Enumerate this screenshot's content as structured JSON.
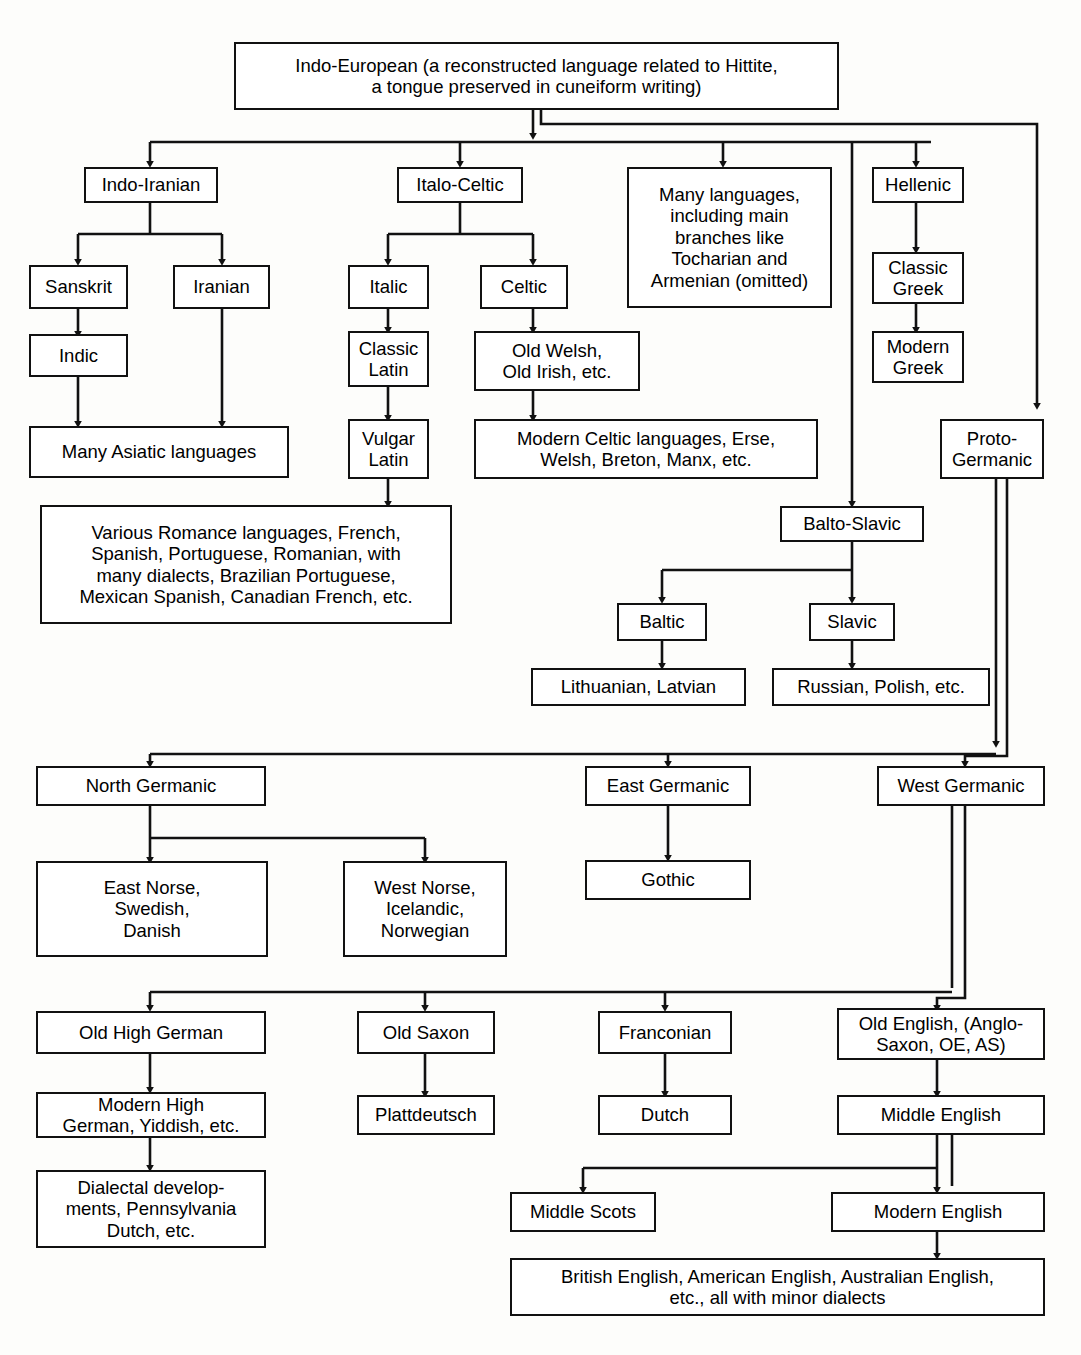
{
  "diagram": {
    "colors": {
      "ink": "#111111",
      "paper": "#fdfdfb",
      "box_fill": "#ffffff"
    },
    "nodes": {
      "indo_european": "Indo-European (a reconstructed language related to Hittite,\na tongue preserved in cuneiform writing)",
      "indo_iranian": "Indo-Iranian",
      "italo_celtic": "Italo-Celtic",
      "many_languages": "Many languages,\nincluding main\nbranches like\nTocharian and\nArmenian (omitted)",
      "hellenic": "Hellenic",
      "sanskrit": "Sanskrit",
      "iranian": "Iranian",
      "italic": "Italic",
      "celtic": "Celtic",
      "classic_greek": "Classic\nGreek",
      "indic": "Indic",
      "classic_latin": "Classic\nLatin",
      "old_welsh": "Old Welsh,\nOld Irish, etc.",
      "modern_greek": "Modern\nGreek",
      "many_asiatic": "Many Asiatic languages",
      "vulgar_latin": "Vulgar\nLatin",
      "modern_celtic": "Modern Celtic languages, Erse,\nWelsh, Breton, Manx, etc.",
      "proto_germanic": "Proto-\nGermanic",
      "romance": "Various Romance languages, French,\nSpanish, Portuguese, Romanian, with\nmany dialects, Brazilian Portuguese,\nMexican Spanish, Canadian French, etc.",
      "balto_slavic": "Balto-Slavic",
      "baltic": "Baltic",
      "slavic": "Slavic",
      "lithuanian": "Lithuanian, Latvian",
      "russian": "Russian, Polish, etc.",
      "north_germanic": "North Germanic",
      "east_germanic": "East Germanic",
      "west_germanic": "West Germanic",
      "east_norse": "East Norse,\nSwedish,\nDanish",
      "west_norse": "West Norse,\nIcelandic,\nNorwegian",
      "gothic": "Gothic",
      "old_high_german": "Old High German",
      "old_saxon": "Old Saxon",
      "franconian": "Franconian",
      "old_english": "Old English, (Anglo-\nSaxon, OE, AS)",
      "modern_high_german": "Modern High\nGerman, Yiddish, etc.",
      "plattdeutsch": "Plattdeutsch",
      "dutch": "Dutch",
      "middle_english": "Middle English",
      "dialectal": "Dialectal develop-\nments, Pennsylvania\nDutch, etc.",
      "middle_scots": "Middle Scots",
      "modern_english": "Modern English",
      "british_english": "British English, American English, Australian English,\netc., all with minor dialects"
    }
  }
}
